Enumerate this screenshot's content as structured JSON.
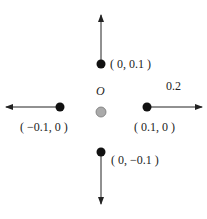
{
  "diagram": {
    "origin": {
      "label": "O",
      "color": "#aaaaaa"
    },
    "points": [
      {
        "id": "up",
        "label": "( 0,  0.1 )",
        "color": "#111111"
      },
      {
        "id": "left",
        "label": "( −0.1,  0 )",
        "color": "#111111"
      },
      {
        "id": "right",
        "label": "( 0.1,  0 )",
        "color": "#111111"
      },
      {
        "id": "down",
        "label": "( 0,  −0.1 )",
        "color": "#111111"
      }
    ],
    "step_label": "0.2"
  }
}
